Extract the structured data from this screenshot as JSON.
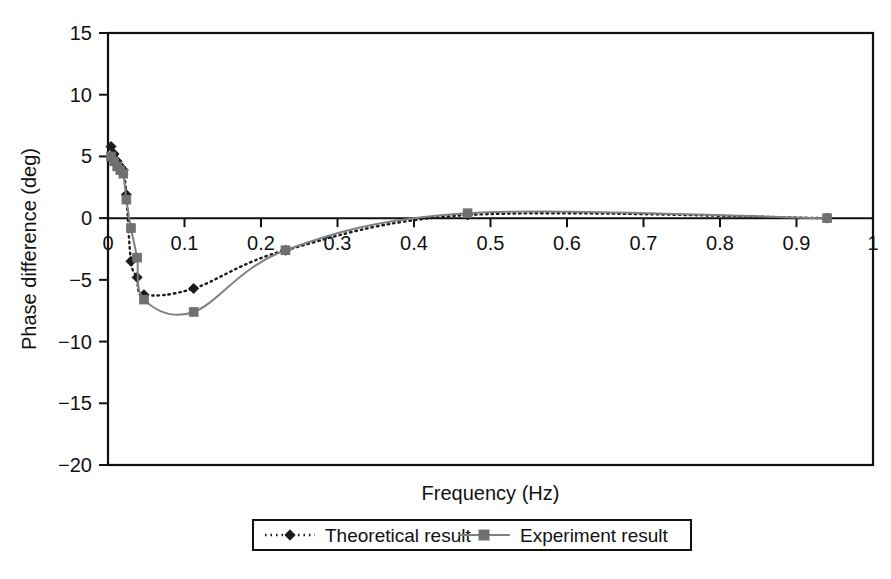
{
  "chart_data": {
    "type": "line",
    "title": "",
    "xlabel": "Frequency (Hz)",
    "ylabel": "Phase difference (deg)",
    "xlim": [
      0,
      1
    ],
    "ylim": [
      -20,
      15
    ],
    "xticks": [
      "0",
      "0.1",
      "0.2",
      "0.3",
      "0.4",
      "0.5",
      "0.6",
      "0.7",
      "0.8",
      "0.9",
      "1"
    ],
    "xtick_values": [
      0,
      0.1,
      0.2,
      0.3,
      0.4,
      0.5,
      0.6,
      0.7,
      0.8,
      0.9,
      1
    ],
    "yticks": [
      "15",
      "10",
      "5",
      "0",
      "−5",
      "−10",
      "−15",
      "−20"
    ],
    "ytick_values": [
      15,
      10,
      5,
      0,
      -5,
      -10,
      -15,
      -20
    ],
    "grid": false,
    "legend_position": "below-center",
    "series": [
      {
        "name": "Theoretical result",
        "color": "#1a1a1a",
        "line_style": "dotted",
        "marker": "diamond",
        "marker_color": "#1a1a1a",
        "x": [
          0.004,
          0.008,
          0.012,
          0.016,
          0.02,
          0.024,
          0.03,
          0.038,
          0.047,
          0.112,
          0.232,
          0.47,
          0.94
        ],
        "y": [
          5.8,
          5.2,
          4.6,
          4.2,
          3.9,
          1.9,
          -3.5,
          -4.8,
          -6.2,
          -5.7,
          -2.6,
          0.25,
          0.0
        ]
      },
      {
        "name": "Experiment result",
        "color": "#808080",
        "line_style": "solid",
        "marker": "square",
        "marker_color": "#707070",
        "x": [
          0.004,
          0.008,
          0.012,
          0.016,
          0.02,
          0.024,
          0.03,
          0.038,
          0.047,
          0.112,
          0.232,
          0.47,
          0.94
        ],
        "y": [
          5.0,
          4.6,
          4.2,
          3.9,
          3.6,
          1.5,
          -0.8,
          -3.2,
          -6.6,
          -7.6,
          -2.6,
          0.4,
          0.0
        ]
      }
    ]
  },
  "legend": {
    "items": [
      {
        "label": "Theoretical result"
      },
      {
        "label": "Experiment result"
      }
    ]
  },
  "axes": {
    "x_title": "Frequency (Hz)",
    "y_title": "Phase difference (deg)"
  }
}
